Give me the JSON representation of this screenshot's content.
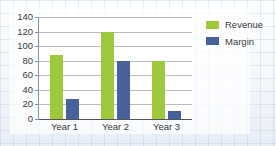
{
  "chart_data": {
    "type": "bar",
    "title": "",
    "subtitle": "",
    "xlabel": "",
    "ylabel": "",
    "categories": [
      "Year 1",
      "Year 2",
      "Year 3"
    ],
    "series": [
      {
        "name": "Revenue",
        "color": "#9fc93c",
        "values": [
          88,
          120,
          79
        ]
      },
      {
        "name": "Margin",
        "color": "#47619b",
        "values": [
          28,
          80,
          11
        ]
      }
    ],
    "ylim": [
      0,
      140
    ],
    "yticks": [
      0,
      20,
      40,
      60,
      80,
      100,
      120,
      140
    ],
    "ytick_labels": [
      "0",
      "20",
      "40",
      "60",
      "80",
      "100",
      "120",
      "140"
    ],
    "grid": true,
    "grid_axis": "y",
    "legend": true,
    "legend_position": "right"
  },
  "legend": {
    "entries": [
      {
        "label": "Revenue",
        "swatch": "revenue-swatch-icon"
      },
      {
        "label": "Margin",
        "swatch": "margin-swatch-icon"
      }
    ]
  }
}
